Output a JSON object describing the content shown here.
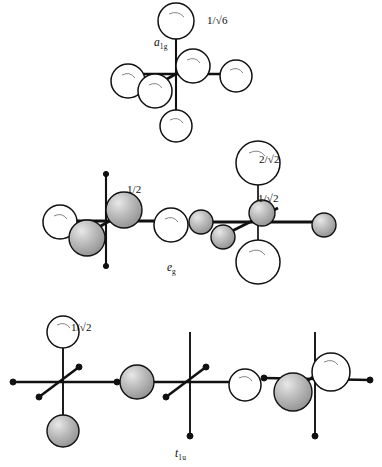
{
  "figure": {
    "background_color": "#ffffff",
    "ink_color": "#111111",
    "sphere_light_fill": "#ffffff",
    "sphere_shaded_fill": "#b4b4b4"
  },
  "rows": [
    {
      "id": "row-a1g",
      "symmetry_label": "a",
      "symmetry_sub": "1g",
      "groups": [
        {
          "id": "a1g-1",
          "coefficient": "1/√6",
          "spheres": [
            {
              "position": "z-up",
              "phase": "light"
            },
            {
              "position": "z-down",
              "phase": "light"
            },
            {
              "position": "x-left",
              "phase": "light"
            },
            {
              "position": "x-right",
              "phase": "light"
            },
            {
              "position": "y-front",
              "phase": "light"
            },
            {
              "position": "y-back",
              "phase": "light"
            }
          ]
        }
      ]
    },
    {
      "id": "row-eg",
      "symmetry_label": "e",
      "symmetry_sub": "g",
      "groups": [
        {
          "id": "eg-1",
          "coefficient": "1/2",
          "spheres": [
            {
              "position": "x-left",
              "phase": "light"
            },
            {
              "position": "x-right",
              "phase": "light"
            },
            {
              "position": "y-front",
              "phase": "shaded"
            },
            {
              "position": "y-back",
              "phase": "shaded"
            }
          ]
        },
        {
          "id": "eg-2",
          "coefficient_axial": "2/√2",
          "coefficient_equatorial": "1/√2",
          "spheres": [
            {
              "position": "z-up",
              "phase": "light"
            },
            {
              "position": "z-down",
              "phase": "light"
            },
            {
              "position": "x-left",
              "phase": "shaded"
            },
            {
              "position": "x-right",
              "phase": "shaded"
            },
            {
              "position": "y-front",
              "phase": "shaded"
            },
            {
              "position": "y-back",
              "phase": "shaded"
            }
          ]
        }
      ]
    },
    {
      "id": "row-t1u",
      "symmetry_label": "t",
      "symmetry_sub": "1u",
      "groups": [
        {
          "id": "t1u-1",
          "coefficient": "1/√2",
          "spheres": [
            {
              "position": "z-up",
              "phase": "light"
            },
            {
              "position": "z-down",
              "phase": "shaded"
            }
          ]
        },
        {
          "id": "t1u-2",
          "coefficient": "",
          "spheres": [
            {
              "position": "x-left",
              "phase": "shaded"
            },
            {
              "position": "x-right",
              "phase": "light"
            }
          ]
        },
        {
          "id": "t1u-3",
          "coefficient": "",
          "spheres": [
            {
              "position": "y-back",
              "phase": "light"
            },
            {
              "position": "y-front",
              "phase": "shaded"
            }
          ]
        }
      ]
    }
  ]
}
